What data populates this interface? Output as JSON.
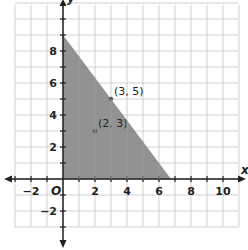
{
  "chart_data": {
    "type": "area",
    "title": "",
    "xlabel": "x",
    "ylabel": "y",
    "origin_label": "O",
    "xlim": [
      -3,
      11
    ],
    "ylim": [
      -3,
      11
    ],
    "grid": true,
    "grid_step": 1,
    "x_ticks": [
      -2,
      2,
      4,
      6,
      8,
      10
    ],
    "y_ticks": [
      -2,
      2,
      4,
      6,
      8
    ],
    "x_tick_labels": [
      "−2",
      "2",
      "4",
      "6",
      "8",
      "10"
    ],
    "y_tick_labels": [
      "−2",
      "2",
      "4",
      "6",
      "8"
    ],
    "shaded_region": {
      "description": "Triangle bounded by x = 0, y = 0, and line 4x + 3y = 27",
      "vertices": [
        [
          0,
          0
        ],
        [
          0,
          9
        ],
        [
          6.75,
          0
        ]
      ],
      "fill": "#8c8c8c"
    },
    "points": [
      {
        "x": 3,
        "y": 5,
        "label": "(3, 5)"
      },
      {
        "x": 2,
        "y": 3,
        "label": "(2, 3)"
      }
    ],
    "colors": {
      "grid": "#cfcfcf",
      "axis": "#231f20",
      "shade": "#8c8c8c",
      "point": "#555555"
    }
  }
}
